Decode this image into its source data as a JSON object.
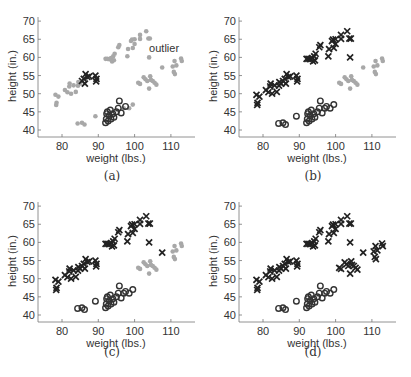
{
  "figure": {
    "captions": [
      "(a)",
      "(b)",
      "(c)",
      "(d)"
    ],
    "annotation": "outlier"
  },
  "chart_data": [
    {
      "panel": "(a)",
      "type": "scatter",
      "title": "",
      "xlabel": "weight (lbs.)",
      "ylabel": "height (in.)",
      "xticks": [
        80,
        90,
        100,
        110
      ],
      "yticks": [
        40,
        45,
        50,
        55,
        60,
        65,
        70
      ],
      "xlim": [
        73.5,
        116.5
      ],
      "ylim": [
        38,
        71.5
      ],
      "grid": false,
      "annotations": [
        {
          "text": "outlier",
          "x": 104,
          "y": 61.5
        }
      ],
      "series": [
        {
          "name": "labeled-x",
          "marker": "x",
          "color": "#222222"
        },
        {
          "name": "labeled-o",
          "marker": "o",
          "color": "#333333"
        },
        {
          "name": "unlabeled",
          "marker": "dot",
          "color": "#a8a8a8"
        }
      ]
    },
    {
      "panel": "(b)",
      "type": "scatter",
      "xlabel": "weight (lbs.)",
      "ylabel": "height (in.)",
      "xticks": [
        80,
        90,
        100,
        110
      ],
      "yticks": [
        40,
        45,
        50,
        55,
        60,
        65,
        70
      ],
      "series": [
        {
          "name": "class-x",
          "marker": "x",
          "color": "#222222"
        },
        {
          "name": "class-o",
          "marker": "o",
          "color": "#333333"
        },
        {
          "name": "unlabeled",
          "marker": "dot",
          "color": "#a8a8a8"
        }
      ]
    },
    {
      "panel": "(c)",
      "type": "scatter",
      "xlabel": "weight (lbs.)",
      "ylabel": "height (in.)",
      "xticks": [
        80,
        90,
        100,
        110
      ],
      "yticks": [
        40,
        45,
        50,
        55,
        60,
        65,
        70
      ],
      "series": [
        {
          "name": "class-x",
          "marker": "x",
          "color": "#222222"
        },
        {
          "name": "class-o",
          "marker": "o",
          "color": "#333333"
        },
        {
          "name": "unlabeled",
          "marker": "dot",
          "color": "#a8a8a8"
        }
      ]
    },
    {
      "panel": "(d)",
      "type": "scatter",
      "xlabel": "weight (lbs.)",
      "ylabel": "height (in.)",
      "xticks": [
        80,
        90,
        100,
        110
      ],
      "yticks": [
        40,
        45,
        50,
        55,
        60,
        65,
        70
      ],
      "series": [
        {
          "name": "class-x",
          "marker": "x",
          "color": "#222222"
        },
        {
          "name": "class-o",
          "marker": "o",
          "color": "#333333"
        }
      ]
    }
  ],
  "points": {
    "upper_band": [
      [
        78.2,
        49.7
      ],
      [
        78.5,
        47.5
      ],
      [
        78.4,
        46.9
      ],
      [
        79.0,
        49.2
      ],
      [
        80.8,
        51.0
      ],
      [
        81.5,
        50.4
      ],
      [
        82.0,
        52.0
      ],
      [
        82.1,
        52.8
      ],
      [
        82.5,
        50.0
      ],
      [
        83.2,
        52.3
      ],
      [
        83.8,
        50.5
      ],
      [
        84.4,
        52.2
      ],
      [
        84.5,
        53.2
      ],
      [
        85.0,
        52.8
      ],
      [
        85.5,
        53.5
      ],
      [
        86.0,
        54.1
      ],
      [
        86.3,
        52.8
      ],
      [
        86.5,
        55.4
      ],
      [
        87.0,
        54.6
      ],
      [
        87.5,
        54.8
      ],
      [
        89.2,
        55.0
      ],
      [
        89.4,
        53.4
      ],
      [
        89.5,
        54.1
      ],
      [
        92.0,
        59.6
      ],
      [
        92.5,
        59.6
      ],
      [
        93.0,
        59.5
      ],
      [
        93.5,
        59.8
      ],
      [
        93.8,
        58.9
      ],
      [
        94.1,
        60.3
      ],
      [
        94.3,
        59.2
      ],
      [
        94.5,
        61.0
      ],
      [
        95.5,
        62.8
      ],
      [
        95.8,
        63.4
      ],
      [
        98.0,
        60.3
      ],
      [
        98.2,
        62.3
      ],
      [
        99.0,
        64.5
      ],
      [
        99.3,
        64.9
      ],
      [
        99.5,
        62.6
      ],
      [
        100.0,
        65.0
      ],
      [
        100.0,
        63.7
      ],
      [
        101.5,
        65.1
      ],
      [
        101.5,
        66.2
      ],
      [
        103.2,
        67.2
      ],
      [
        103.8,
        65.2
      ],
      [
        104.2,
        65.2
      ]
    ],
    "lower_right": [
      [
        104.0,
        60.0
      ],
      [
        107.6,
        57.2
      ],
      [
        101.0,
        53.0
      ],
      [
        101.5,
        52.7
      ],
      [
        102.5,
        54.5
      ],
      [
        103.0,
        54.0
      ],
      [
        103.5,
        53.5
      ],
      [
        104.0,
        51.4
      ],
      [
        104.3,
        54.8
      ],
      [
        104.5,
        53.8
      ],
      [
        105.0,
        53.5
      ],
      [
        105.5,
        53.0
      ],
      [
        106.0,
        52.5
      ],
      [
        110.5,
        57.5
      ],
      [
        110.8,
        56.0
      ],
      [
        111.0,
        59.0
      ],
      [
        111.1,
        55.4
      ],
      [
        111.5,
        57.8
      ],
      [
        112.8,
        59.7
      ],
      [
        113.0,
        59.0
      ]
    ],
    "circles": [
      [
        84.3,
        41.8
      ],
      [
        85.5,
        42.0
      ],
      [
        86.2,
        41.5
      ],
      [
        89.2,
        43.8
      ],
      [
        92.0,
        42.0
      ],
      [
        92.2,
        43.0
      ],
      [
        92.3,
        44.5
      ],
      [
        92.5,
        45.0
      ],
      [
        92.7,
        42.5
      ],
      [
        93.0,
        44.0
      ],
      [
        93.3,
        45.5
      ],
      [
        93.5,
        43.0
      ],
      [
        94.0,
        44.5
      ],
      [
        94.3,
        43.5
      ],
      [
        95.0,
        45.0
      ],
      [
        95.5,
        46.0
      ],
      [
        95.8,
        48.0
      ],
      [
        96.3,
        44.7
      ],
      [
        97.0,
        46.0
      ],
      [
        97.5,
        46.5
      ],
      [
        98.5,
        46.0
      ],
      [
        99.5,
        47.0
      ]
    ]
  },
  "assignment": {
    "a_x_labeled": [
      14,
      15,
      16,
      17,
      18,
      19,
      20,
      21,
      22
    ],
    "a_o_labeled": [
      4,
      5,
      6,
      7,
      8,
      9,
      10,
      11,
      12,
      13,
      14,
      15,
      16,
      17,
      19
    ]
  }
}
